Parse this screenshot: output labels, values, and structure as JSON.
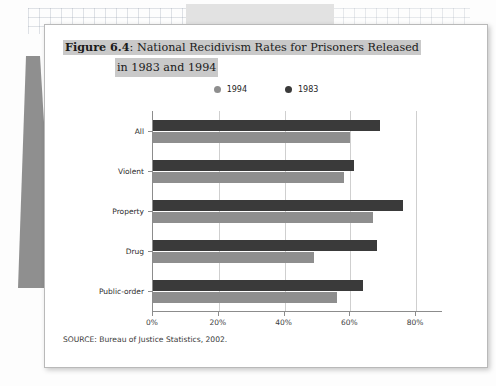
{
  "background": {
    "top_band_color": "#e2e2e2",
    "wedge_color": "#8f8f8f"
  },
  "figure": {
    "number_label": "Figure 6.4",
    "colon": ":",
    "title_line1": "National Recidivism Rates for Prisoners Released",
    "title_line2": "in 1983 and 1994",
    "source": "SOURCE: Bureau of Justice Statistics, 2002."
  },
  "colors": {
    "series_1994": "#8e8e8e",
    "series_1983": "#3a3a3a",
    "gridline": "#cfcfcf",
    "axis": "#8c8c8c"
  },
  "chart_data": {
    "type": "bar",
    "orientation": "horizontal",
    "title": "National Recidivism Rates for Prisoners Released in 1983 and 1994",
    "xlabel": "",
    "ylabel": "",
    "xlim": [
      0,
      80
    ],
    "grid": true,
    "legend_position": "top-center",
    "xticks": [
      "0%",
      "20%",
      "40%",
      "60%",
      "80%"
    ],
    "xtick_values": [
      0,
      20,
      40,
      60,
      80
    ],
    "categories": [
      "All",
      "Violent",
      "Property",
      "Drug",
      "Public-order"
    ],
    "series": [
      {
        "name": "1983",
        "color": "#3a3a3a",
        "values": [
          69,
          61,
          76,
          68,
          64
        ]
      },
      {
        "name": "1994",
        "color": "#8e8e8e",
        "values": [
          60,
          58,
          67,
          49,
          56
        ]
      }
    ]
  }
}
